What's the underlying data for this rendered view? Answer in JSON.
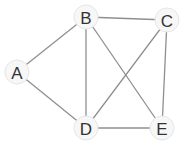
{
  "graph": {
    "title": "",
    "nodes": [
      {
        "id": "A",
        "label": "A",
        "x": 17,
        "y": 72
      },
      {
        "id": "B",
        "label": "B",
        "x": 86,
        "y": 17
      },
      {
        "id": "C",
        "label": "C",
        "x": 167,
        "y": 20
      },
      {
        "id": "D",
        "label": "D",
        "x": 86,
        "y": 128
      },
      {
        "id": "E",
        "label": "E",
        "x": 162,
        "y": 128
      }
    ],
    "edges": [
      {
        "from": "A",
        "to": "B"
      },
      {
        "from": "A",
        "to": "D"
      },
      {
        "from": "B",
        "to": "C"
      },
      {
        "from": "B",
        "to": "D"
      },
      {
        "from": "B",
        "to": "E"
      },
      {
        "from": "C",
        "to": "D"
      },
      {
        "from": "C",
        "to": "E"
      },
      {
        "from": "D",
        "to": "E"
      }
    ],
    "colors": {
      "edge": "#8f8f8f",
      "node_fill": "#f7f7f7",
      "label": "#333333"
    }
  }
}
